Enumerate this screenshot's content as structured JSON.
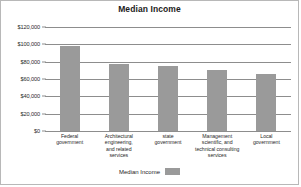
{
  "chart_data": {
    "type": "bar",
    "title": "Median Income",
    "xlabel": "",
    "ylabel": "",
    "ylim": [
      0,
      120000
    ],
    "ytick_values": [
      120000,
      100000,
      80000,
      60000,
      40000,
      20000,
      0
    ],
    "ytick_labels": [
      "$120,000",
      "$100,000",
      "$80,000",
      "$60,000",
      "$40,000",
      "$20,000",
      "$0"
    ],
    "grid": true,
    "legend_position": "bottom",
    "bar_color": "#9a9a9a",
    "categories": [
      "Federal government",
      "Architectural engineering, and related services",
      "state government",
      "Management scientific, and technical consulting services",
      "Local government"
    ],
    "category_lines": [
      [
        "Federal",
        "government"
      ],
      [
        "Architectural",
        "engineering,",
        "and related",
        "services"
      ],
      [
        "state",
        "government"
      ],
      [
        "Management",
        "scientific, and",
        "technical consulting",
        "services"
      ],
      [
        "Local",
        "government"
      ]
    ],
    "series": [
      {
        "name": "Median Income",
        "values": [
          98000,
          77500,
          74500,
          70000,
          65500
        ]
      }
    ]
  },
  "legend": {
    "label": "Median Income"
  }
}
